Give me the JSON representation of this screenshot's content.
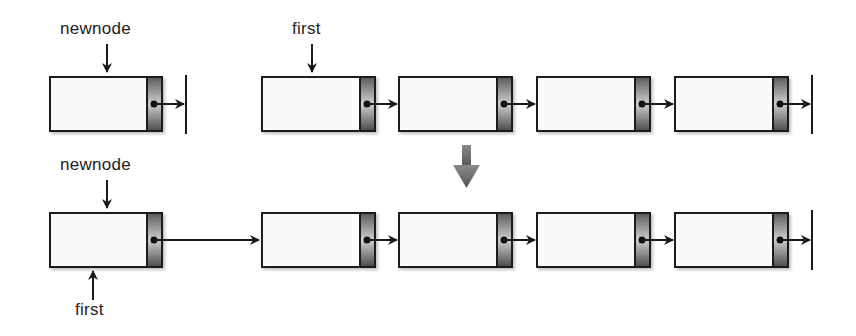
{
  "diagram": {
    "top_row": {
      "pointer_labels": {
        "newnode": "newnode",
        "first": "first"
      },
      "newnode_box": {
        "x": 50,
        "y": 77,
        "w": 112,
        "h": 54
      },
      "list_boxes": [
        {
          "x": 262,
          "y": 77,
          "w": 113,
          "h": 54
        },
        {
          "x": 399,
          "y": 77,
          "w": 113,
          "h": 54
        },
        {
          "x": 537,
          "y": 77,
          "w": 113,
          "h": 54
        },
        {
          "x": 675,
          "y": 77,
          "w": 113,
          "h": 54
        }
      ]
    },
    "transition_arrow": "down-arrow",
    "bottom_row": {
      "pointer_labels": {
        "newnode": "newnode",
        "first": "first"
      },
      "newnode_box": {
        "x": 50,
        "y": 213,
        "w": 112,
        "h": 54
      },
      "list_boxes": [
        {
          "x": 262,
          "y": 213,
          "w": 113,
          "h": 54
        },
        {
          "x": 399,
          "y": 213,
          "w": 113,
          "h": 54
        },
        {
          "x": 537,
          "y": 213,
          "w": 113,
          "h": 54
        },
        {
          "x": 675,
          "y": 213,
          "w": 113,
          "h": 54
        }
      ]
    },
    "colors": {
      "outline": "#1a1a1a",
      "box_fill": "#fafafa",
      "pointer_dark": "#555555",
      "pointer_light": "#cfcfcf",
      "arrow": "#1a1a1a",
      "down_arrow": "#777777"
    }
  }
}
